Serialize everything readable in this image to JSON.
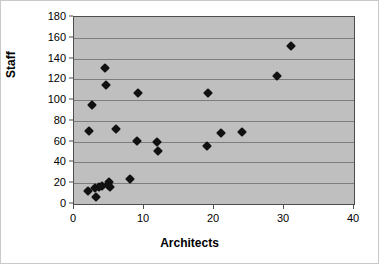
{
  "chart_data": {
    "type": "scatter",
    "title": "",
    "xlabel": "Architects",
    "ylabel": "Staff",
    "xlim": [
      0,
      40
    ],
    "ylim": [
      0,
      180
    ],
    "xticks": [
      0,
      10,
      20,
      30,
      40
    ],
    "yticks": [
      0,
      20,
      40,
      60,
      80,
      100,
      120,
      140,
      160,
      180
    ],
    "grid": "horizontal",
    "legend": "none",
    "plot_background": "#bfbfbf",
    "marker_color": "#111111",
    "marker_shape": "diamond",
    "points": [
      {
        "x": 2.0,
        "y": 13
      },
      {
        "x": 2.2,
        "y": 70
      },
      {
        "x": 2.6,
        "y": 95
      },
      {
        "x": 3.0,
        "y": 15
      },
      {
        "x": 3.1,
        "y": 7
      },
      {
        "x": 3.6,
        "y": 16
      },
      {
        "x": 4.0,
        "y": 17
      },
      {
        "x": 4.4,
        "y": 131
      },
      {
        "x": 4.5,
        "y": 115
      },
      {
        "x": 4.8,
        "y": 18
      },
      {
        "x": 5.0,
        "y": 21
      },
      {
        "x": 5.1,
        "y": 16
      },
      {
        "x": 6.0,
        "y": 72
      },
      {
        "x": 8.0,
        "y": 24
      },
      {
        "x": 9.0,
        "y": 61
      },
      {
        "x": 9.2,
        "y": 107
      },
      {
        "x": 11.8,
        "y": 60
      },
      {
        "x": 12.0,
        "y": 51
      },
      {
        "x": 19.0,
        "y": 56
      },
      {
        "x": 19.2,
        "y": 107
      },
      {
        "x": 21.0,
        "y": 68
      },
      {
        "x": 24.0,
        "y": 69
      },
      {
        "x": 29.0,
        "y": 123
      },
      {
        "x": 31.0,
        "y": 152
      }
    ]
  },
  "axes": {
    "y_title": "Staff",
    "x_title": "Architects",
    "y_tick_labels": [
      "0",
      "20",
      "40",
      "60",
      "80",
      "100",
      "120",
      "140",
      "160",
      "180"
    ],
    "x_tick_labels": [
      "0",
      "10",
      "20",
      "30",
      "40"
    ]
  }
}
